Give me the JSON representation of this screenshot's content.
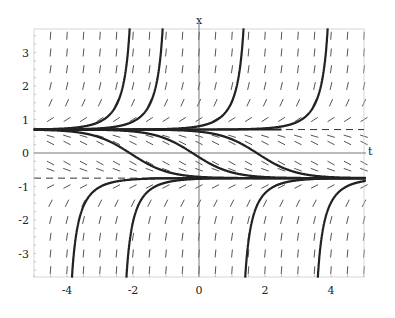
{
  "chart_data": {
    "type": "line",
    "title": "",
    "xlabel": "t",
    "ylabel": "x",
    "xlim": [
      -5,
      5
    ],
    "ylim": [
      -3.7,
      3.7
    ],
    "xticks": [
      "-4",
      "-2",
      "0",
      "2",
      "4"
    ],
    "yticks": [
      "-3",
      "-2",
      "-1",
      "0",
      "1",
      "2",
      "3"
    ],
    "grid": false,
    "slope_field": true,
    "equilibria": [
      {
        "x": 0.7,
        "style": "dashed",
        "stability": "unstable"
      },
      {
        "x": -0.75,
        "style": "dashed",
        "stability": "stable"
      }
    ],
    "series": [
      {
        "name": "blowup-1",
        "blowup_t": -2.1,
        "direction": "up"
      },
      {
        "name": "blowup-2",
        "blowup_t": -1.1,
        "direction": "up"
      },
      {
        "name": "blowup-3",
        "blowup_t": 1.35,
        "direction": "up"
      },
      {
        "name": "blowup-4",
        "blowup_t": 3.9,
        "direction": "up"
      },
      {
        "name": "descending-1",
        "cross_zero_t": -2.1
      },
      {
        "name": "descending-2",
        "cross_zero_t": -0.2
      },
      {
        "name": "descending-3",
        "cross_zero_t": 1.75
      },
      {
        "name": "from-below-1",
        "start_t": -3.85
      },
      {
        "name": "from-below-2",
        "start_t": -2.2
      },
      {
        "name": "from-below-3",
        "start_t": 1.4
      },
      {
        "name": "from-below-4",
        "start_t": 3.6
      }
    ]
  }
}
